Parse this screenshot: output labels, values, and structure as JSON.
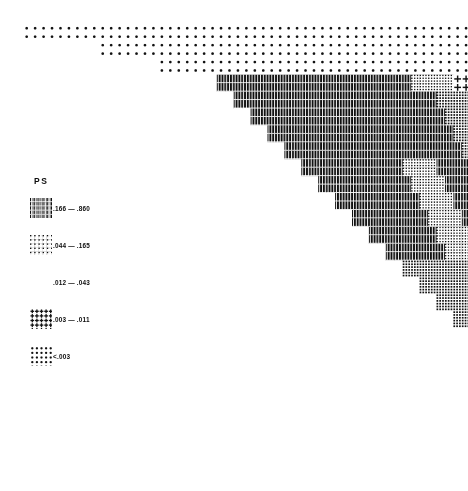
{
  "figure": {
    "kind": "shade-plot",
    "legend_title": "PS",
    "background_color": "#ffffff",
    "ink_color": "#111111"
  },
  "legend": {
    "title": "PS",
    "entries": [
      {
        "id": "bin1",
        "label": ".166 — .860",
        "pattern": "dense-vertical-bars",
        "range": [
          0.166,
          0.86
        ],
        "density": 0.92
      },
      {
        "id": "bin2",
        "label": ".044 — .165",
        "pattern": "coarse-grid",
        "range": [
          0.044,
          0.165
        ],
        "density": 0.7
      },
      {
        "id": "bin3",
        "label": ".012 — .043",
        "pattern": "medium-grid",
        "range": [
          0.012,
          0.043
        ],
        "density": 0.45
      },
      {
        "id": "bin4",
        "label": ".003 — .011",
        "pattern": "plus-marks",
        "range": [
          0.003,
          0.011
        ],
        "density": 0.22
      },
      {
        "id": "bin5",
        "label": "<.003",
        "pattern": "sparse-dots",
        "range": [
          0.0,
          0.003
        ],
        "density": 0.1
      }
    ]
  },
  "chart_data": {
    "type": "heatmap",
    "title": "",
    "subtitle": "",
    "xlabel": "",
    "ylabel": "",
    "legend_position": "left",
    "grid": false,
    "shape": "upper-triangular",
    "rows": 54,
    "cols": 54,
    "cell_px": 8.45,
    "origin_px": [
      14,
      24
    ],
    "bin_labels": [
      ".166 — .860",
      ".044 — .165",
      ".012 — .043",
      ".003 — .011",
      "<.003"
    ],
    "staircase_step_rows": 2,
    "note": "Cell shading encodes the PS value binned into 5 classes; bin 1 darkest.",
    "regions": [
      {
        "bin": 5,
        "r0": 0,
        "r1": 2,
        "c0": 1,
        "c1": 54,
        "desc": "top two rows, sparse"
      },
      {
        "bin": 5,
        "r0": 2,
        "r1": 4,
        "c0": 10,
        "c1": 54,
        "desc": "rows 3-4 sparse"
      },
      {
        "bin": 5,
        "r0": 4,
        "r1": 6,
        "c0": 17,
        "c1": 54,
        "desc": "rows 5-6 sparse"
      },
      {
        "bin": 1,
        "r0": 6,
        "r1": 8,
        "c0": 24,
        "c1": 52,
        "desc": "first dark band"
      },
      {
        "bin": 1,
        "r0": 8,
        "r1": 30,
        "c0": 26,
        "c1": 52,
        "desc": "main dark block core"
      },
      {
        "bin": 2,
        "r0": 6,
        "r1": 9,
        "c0": 78,
        "c1": 82,
        "desc": "light patch top-right of dark block"
      },
      {
        "bin": 3,
        "r0": 9,
        "r1": 30,
        "c0": 78,
        "c1": 100,
        "desc": "mid-density right wing"
      },
      {
        "bin": 2,
        "r0": 18,
        "r1": 30,
        "c0": 60,
        "c1": 70,
        "desc": "mid patch"
      },
      {
        "bin": 3,
        "r0": 30,
        "r1": 44,
        "c0": 74,
        "c1": 100,
        "desc": "lower mid block"
      },
      {
        "bin": 2,
        "r0": 34,
        "r1": 40,
        "c0": 92,
        "c1": 98,
        "desc": "light square low-mid"
      },
      {
        "bin": 4,
        "r0": 6,
        "r1": 54,
        "c0": 100,
        "c1": 54,
        "desc": "right-hand plus region"
      },
      {
        "bin": 3,
        "r0": 44,
        "r1": 48,
        "c0": 100,
        "c1": 106,
        "desc": "small light block"
      },
      {
        "bin": 3,
        "r0": 48,
        "r1": 54,
        "c0": 112,
        "c1": 120,
        "desc": "bottom-right light blocks"
      }
    ],
    "cells_encoded": {
      "encoding": "per-row run-length: [[binIndex, runLengthInCells], ...] starting at the row's first shaded column",
      "row_first_col": [
        1,
        1,
        10,
        10,
        17,
        17,
        24,
        24,
        26,
        26,
        28,
        28,
        30,
        30,
        32,
        32,
        34,
        34,
        36,
        36,
        38,
        38,
        40,
        40,
        42,
        42,
        44,
        44,
        46,
        46,
        48,
        48,
        50,
        50,
        52,
        52,
        54,
        54,
        56,
        56,
        58,
        58,
        60,
        60,
        62,
        62,
        64,
        64,
        66,
        66,
        68,
        68,
        70,
        70
      ],
      "rows": [
        [
          [
            5,
            53
          ]
        ],
        [
          [
            5,
            53
          ]
        ],
        [
          [
            5,
            44
          ]
        ],
        [
          [
            5,
            44
          ]
        ],
        [
          [
            5,
            37
          ]
        ],
        [
          [
            5,
            37
          ]
        ],
        [
          [
            1,
            23
          ],
          [
            2,
            5
          ],
          [
            4,
            12
          ]
        ],
        [
          [
            1,
            23
          ],
          [
            2,
            5
          ],
          [
            4,
            12
          ]
        ],
        [
          [
            1,
            24
          ],
          [
            3,
            9
          ],
          [
            4,
            10
          ]
        ],
        [
          [
            1,
            24
          ],
          [
            3,
            9
          ],
          [
            4,
            10
          ]
        ],
        [
          [
            1,
            23
          ],
          [
            3,
            9
          ],
          [
            4,
            10
          ]
        ],
        [
          [
            1,
            23
          ],
          [
            3,
            9
          ],
          [
            4,
            10
          ]
        ],
        [
          [
            1,
            22
          ],
          [
            3,
            9
          ],
          [
            4,
            10
          ]
        ],
        [
          [
            1,
            22
          ],
          [
            3,
            9
          ],
          [
            4,
            10
          ]
        ],
        [
          [
            1,
            21
          ],
          [
            3,
            9
          ],
          [
            4,
            10
          ]
        ],
        [
          [
            1,
            21
          ],
          [
            3,
            9
          ],
          [
            4,
            10
          ]
        ],
        [
          [
            1,
            12
          ],
          [
            2,
            4
          ],
          [
            1,
            4
          ],
          [
            3,
            9
          ],
          [
            4,
            10
          ]
        ],
        [
          [
            1,
            12
          ],
          [
            2,
            4
          ],
          [
            1,
            4
          ],
          [
            3,
            9
          ],
          [
            4,
            10
          ]
        ],
        [
          [
            1,
            11
          ],
          [
            2,
            4
          ],
          [
            1,
            4
          ],
          [
            3,
            9
          ],
          [
            4,
            10
          ]
        ],
        [
          [
            1,
            11
          ],
          [
            2,
            4
          ],
          [
            1,
            4
          ],
          [
            3,
            9
          ],
          [
            4,
            10
          ]
        ],
        [
          [
            1,
            10
          ],
          [
            2,
            4
          ],
          [
            1,
            4
          ],
          [
            3,
            9
          ],
          [
            4,
            10
          ]
        ],
        [
          [
            1,
            10
          ],
          [
            2,
            4
          ],
          [
            1,
            4
          ],
          [
            3,
            9
          ],
          [
            4,
            10
          ]
        ],
        [
          [
            1,
            9
          ],
          [
            2,
            4
          ],
          [
            1,
            4
          ],
          [
            3,
            8
          ],
          [
            4,
            10
          ]
        ],
        [
          [
            1,
            9
          ],
          [
            2,
            4
          ],
          [
            1,
            4
          ],
          [
            3,
            8
          ],
          [
            4,
            10
          ]
        ],
        [
          [
            1,
            8
          ],
          [
            2,
            4
          ],
          [
            1,
            4
          ],
          [
            3,
            8
          ],
          [
            4,
            10
          ]
        ],
        [
          [
            1,
            8
          ],
          [
            2,
            4
          ],
          [
            1,
            4
          ],
          [
            3,
            8
          ],
          [
            4,
            10
          ]
        ],
        [
          [
            1,
            7
          ],
          [
            2,
            4
          ],
          [
            1,
            4
          ],
          [
            3,
            7
          ],
          [
            4,
            10
          ]
        ],
        [
          [
            1,
            7
          ],
          [
            2,
            4
          ],
          [
            1,
            4
          ],
          [
            3,
            7
          ],
          [
            4,
            10
          ]
        ],
        [
          [
            3,
            9
          ],
          [
            1,
            4
          ],
          [
            3,
            6
          ],
          [
            4,
            10
          ]
        ],
        [
          [
            3,
            9
          ],
          [
            1,
            4
          ],
          [
            3,
            6
          ],
          [
            4,
            10
          ]
        ],
        [
          [
            3,
            8
          ],
          [
            1,
            4
          ],
          [
            3,
            5
          ],
          [
            4,
            10
          ]
        ],
        [
          [
            3,
            8
          ],
          [
            1,
            4
          ],
          [
            3,
            5
          ],
          [
            4,
            10
          ]
        ],
        [
          [
            3,
            7
          ],
          [
            1,
            4
          ],
          [
            3,
            5
          ],
          [
            4,
            10
          ]
        ],
        [
          [
            3,
            7
          ],
          [
            1,
            4
          ],
          [
            3,
            5
          ],
          [
            4,
            10
          ]
        ],
        [
          [
            3,
            6
          ],
          [
            1,
            3
          ],
          [
            2,
            3
          ],
          [
            3,
            2
          ],
          [
            4,
            10
          ]
        ],
        [
          [
            3,
            6
          ],
          [
            1,
            3
          ],
          [
            2,
            3
          ],
          [
            3,
            2
          ],
          [
            4,
            10
          ]
        ],
        [
          [
            3,
            5
          ],
          [
            1,
            3
          ],
          [
            2,
            3
          ],
          [
            3,
            2
          ],
          [
            4,
            9
          ]
        ],
        [
          [
            3,
            5
          ],
          [
            1,
            3
          ],
          [
            2,
            3
          ],
          [
            3,
            2
          ],
          [
            4,
            9
          ]
        ],
        [
          [
            3,
            4
          ],
          [
            1,
            3
          ],
          [
            2,
            3
          ],
          [
            3,
            2
          ],
          [
            4,
            9
          ]
        ],
        [
          [
            3,
            4
          ],
          [
            1,
            3
          ],
          [
            2,
            3
          ],
          [
            3,
            2
          ],
          [
            4,
            9
          ]
        ],
        [
          [
            3,
            3
          ],
          [
            1,
            3
          ],
          [
            3,
            4
          ],
          [
            4,
            9
          ]
        ],
        [
          [
            3,
            3
          ],
          [
            1,
            3
          ],
          [
            3,
            4
          ],
          [
            4,
            9
          ]
        ],
        [
          [
            1,
            3
          ],
          [
            3,
            3
          ],
          [
            4,
            9
          ]
        ],
        [
          [
            1,
            3
          ],
          [
            3,
            3
          ],
          [
            4,
            9
          ]
        ],
        [
          [
            3,
            3
          ],
          [
            4,
            9
          ]
        ],
        [
          [
            3,
            3
          ],
          [
            4,
            9
          ]
        ],
        [
          [
            4,
            10
          ]
        ],
        [
          [
            4,
            10
          ]
        ],
        [
          [
            3,
            3
          ],
          [
            4,
            5
          ]
        ],
        [
          [
            3,
            3
          ],
          [
            4,
            5
          ]
        ],
        [
          [
            3,
            3
          ],
          [
            4,
            4
          ]
        ],
        [
          [
            3,
            3
          ],
          [
            4,
            4
          ]
        ],
        [
          [
            5,
            4
          ]
        ],
        [
          [
            5,
            4
          ]
        ]
      ]
    }
  }
}
